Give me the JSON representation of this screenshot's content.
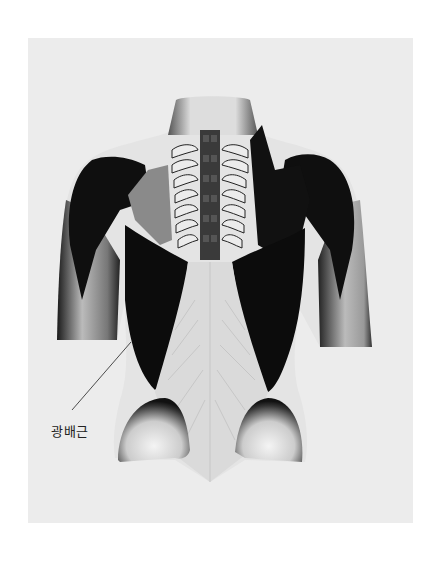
{
  "figure": {
    "background_color": "#ececec",
    "page_color": "#ffffff",
    "muscle_color": "#0d0d0d",
    "skin_color": "#e2e2e2"
  },
  "annotations": [
    {
      "text": "광배근",
      "leader_from": [
        72,
        410
      ],
      "leader_to": [
        131,
        342
      ]
    }
  ]
}
